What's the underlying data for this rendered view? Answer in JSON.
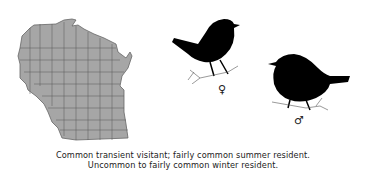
{
  "map": {
    "region": "Wisconsin",
    "fill": "#a6a6a6",
    "border": "#555555"
  },
  "birds": [
    {
      "sex": "female",
      "symbol": "♀"
    },
    {
      "sex": "male",
      "symbol": "♂"
    }
  ],
  "caption": {
    "line1": "Common transient visitant; fairly common summer resident.",
    "line2": "Uncommon to fairly common winter resident."
  }
}
